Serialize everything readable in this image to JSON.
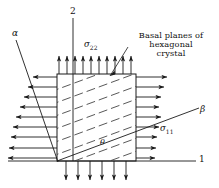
{
  "figure": {
    "type": "mechanics-diagram",
    "background_color": "#ffffff",
    "line_color": "#1a1a1a",
    "hatch_color": "#3a3a3a"
  },
  "labels": {
    "axis_1": "1",
    "axis_2": "2",
    "alpha": "α",
    "beta": "β",
    "theta": "θ",
    "sigma_22": "σ",
    "sigma_22_sub": "22",
    "sigma_11": "σ",
    "sigma_11_sub": "11",
    "caption_line1": "Basal planes of",
    "caption_line2": "hexagonal",
    "caption_line3": "crystal"
  },
  "geometry": {
    "box": {
      "left": 57,
      "top": 74,
      "right": 136,
      "bottom": 161
    },
    "origin_x": 57,
    "origin_y": 161,
    "hatch_angle_deg": -20,
    "hatch_line_count": 9,
    "arrows": {
      "top_count": 10,
      "bottom_count": 6,
      "left_count": 9,
      "right_count": 9,
      "top_direction": "up",
      "bottom_direction": "down",
      "left_direction": "left",
      "right_direction": "right"
    },
    "axis_1_line": {
      "x1": 57,
      "y1": 161,
      "x2": 196,
      "y2": 161
    },
    "axis_2_line": {
      "x1": 73,
      "y1": 18,
      "x2": 73,
      "y2": 161
    },
    "alpha_line": {
      "x1": 17,
      "y1": 42,
      "x2": 57,
      "y2": 161
    },
    "beta_line": {
      "x1": 57,
      "y1": 161,
      "x2": 198,
      "y2": 109
    }
  }
}
